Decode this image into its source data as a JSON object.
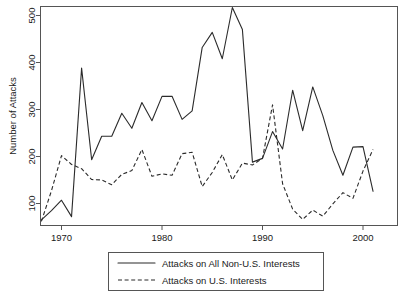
{
  "chart_data": {
    "type": "line",
    "title": "",
    "xlabel": "",
    "ylabel": "Number of Attacks",
    "xlim": [
      1968,
      2001
    ],
    "ylim": [
      55,
      525
    ],
    "grid": false,
    "legend_position": "bottom",
    "xticks": [
      "1970",
      "1980",
      "1990",
      "2000"
    ],
    "xtick_values": [
      1970,
      1980,
      1990,
      2000
    ],
    "yticks": [
      "100",
      "200",
      "300",
      "400",
      "500"
    ],
    "ytick_values": [
      100,
      200,
      300,
      400,
      500
    ],
    "x": [
      1968,
      1969,
      1970,
      1971,
      1972,
      1973,
      1974,
      1975,
      1976,
      1977,
      1978,
      1979,
      1980,
      1981,
      1982,
      1983,
      1984,
      1985,
      1986,
      1987,
      1988,
      1989,
      1990,
      1991,
      1992,
      1993,
      1994,
      1995,
      1996,
      1997,
      1998,
      1999,
      2000,
      2001
    ],
    "series": [
      {
        "name": "Attacks on All Non-U.S. Interests",
        "style": "solid",
        "values": [
          65,
          85,
          107,
          72,
          388,
          193,
          243,
          243,
          292,
          260,
          315,
          276,
          328,
          328,
          279,
          297,
          432,
          464,
          408,
          517,
          470,
          188,
          196,
          253,
          216,
          341,
          255,
          348,
          287,
          213,
          160,
          220,
          221,
          126
        ]
      },
      {
        "name": "Attacks on U.S. Interests",
        "style": "dashed",
        "values": [
          62,
          127,
          202,
          183,
          174,
          151,
          150,
          140,
          162,
          170,
          215,
          158,
          163,
          160,
          206,
          209,
          136,
          166,
          204,
          150,
          186,
          182,
          196,
          310,
          142,
          88,
          66,
          86,
          73,
          99,
          123,
          111,
          169,
          215
        ]
      }
    ]
  },
  "legend": {
    "entries": [
      {
        "label": "Attacks on All Non-U.S. Interests",
        "style": "solid"
      },
      {
        "label": "Attacks on U.S. Interests",
        "style": "dashed"
      }
    ]
  }
}
